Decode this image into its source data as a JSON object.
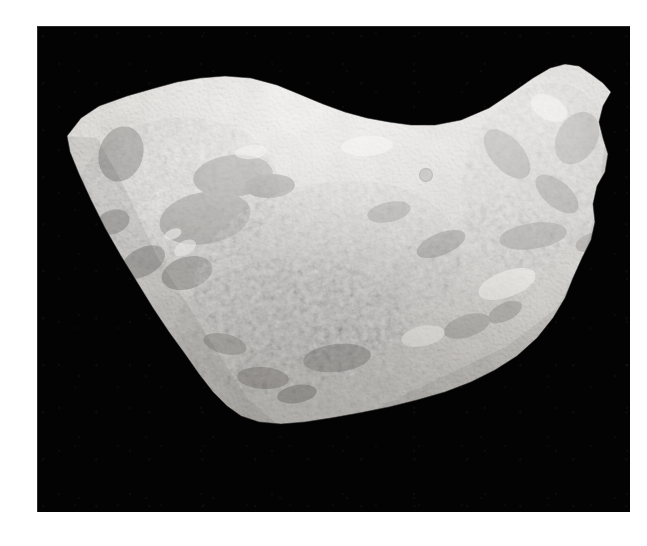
{
  "page": {
    "background_color": "#ffffff",
    "width": 647,
    "height": 546
  },
  "photo": {
    "background_color": "#030303",
    "frame": {
      "x": 37,
      "y": 26,
      "width": 593,
      "height": 486
    },
    "subject": "fossil-bearing limestone slab",
    "medium": "black-and-white photograph",
    "orientation": "landscape"
  },
  "specimen": {
    "name": "fossil-slab",
    "description": "Irregular wedge-shaped rock slab with two upward projections separated by a broad saddle, tapering to a rounded point at lower left-centre.",
    "matrix_color_light": "#e8e6e2",
    "matrix_color_mid": "#bdbab5",
    "matrix_color_shadow": "#8d8a86",
    "fossil_color_dark": "#5d5b58",
    "fossil_color_darkest": "#403e3c",
    "highlight_color": "#f6f5f2",
    "bounds": {
      "left": 65,
      "top": 62,
      "right": 610,
      "bottom": 428
    },
    "features": [
      {
        "name": "left-peak",
        "x": 200,
        "y": 112,
        "label": "upper-left crest"
      },
      {
        "name": "right-peak",
        "x": 562,
        "y": 68,
        "label": "upper-right crest"
      },
      {
        "name": "saddle",
        "x": 390,
        "y": 132,
        "label": "central saddle / notch"
      },
      {
        "name": "lower-tip",
        "x": 262,
        "y": 425,
        "label": "lower rounded tip"
      },
      {
        "name": "circular-impression",
        "x": 426,
        "y": 175,
        "diameter": 13,
        "label": "round darker impression"
      }
    ],
    "texture_zones": [
      {
        "name": "upper-left-fragment-cluster",
        "x": 80,
        "y": 130,
        "w": 175,
        "h": 135
      },
      {
        "name": "central-shell-bed",
        "x": 190,
        "y": 195,
        "w": 240,
        "h": 150
      },
      {
        "name": "right-fragment-band",
        "x": 455,
        "y": 95,
        "w": 130,
        "h": 160
      },
      {
        "name": "lower-central-fragments",
        "x": 175,
        "y": 300,
        "w": 200,
        "h": 110
      },
      {
        "name": "smooth-right-flank",
        "x": 430,
        "y": 260,
        "w": 160,
        "h": 130
      }
    ]
  },
  "accessibility": {
    "alt_text": "Black-and-white photograph of an irregular limestone slab densely packed with small elongated fossil fragments, photographed against a plain black background."
  }
}
